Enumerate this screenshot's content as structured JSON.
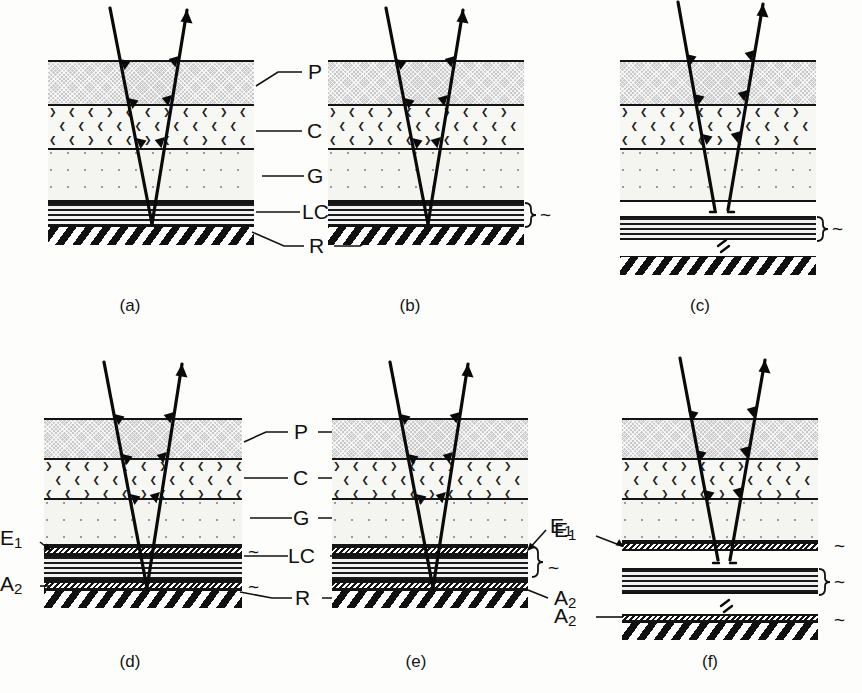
{
  "figure": {
    "type": "optical-layer-stack-diagram",
    "panel_count": 6
  },
  "layer_legend": [
    {
      "key": "P",
      "label": "P",
      "name": "polarizer",
      "texture": "gray-crosshatch"
    },
    {
      "key": "C",
      "label": "C",
      "name": "color-filter",
      "texture": "chevron-field"
    },
    {
      "key": "G",
      "label": "G",
      "name": "glass-substrate",
      "texture": "dot-field"
    },
    {
      "key": "LC",
      "label": "LC",
      "name": "liquid-crystal",
      "texture": "horizontal-stripes"
    },
    {
      "key": "R",
      "label": "R",
      "name": "reflector",
      "texture": "diagonal-hatch"
    },
    {
      "key": "E1",
      "label": "E1",
      "name": "alignment-layer-upper",
      "texture": "sawtooth"
    },
    {
      "key": "A2",
      "label": "A2",
      "name": "alignment-layer-lower",
      "texture": "sawtooth"
    }
  ],
  "center_labels_top": [
    "P",
    "C",
    "G",
    "LC",
    "R"
  ],
  "center_labels_bottom": [
    "P",
    "C",
    "G",
    "LC",
    "R"
  ],
  "panels": [
    {
      "id": "a",
      "caption": "(a)",
      "layers": [
        "P",
        "C",
        "G",
        "LC",
        "R"
      ],
      "separated": false,
      "side_labels": [],
      "tildes": 0,
      "brace": false,
      "ray": "continuous-v-reflection"
    },
    {
      "id": "b",
      "caption": "(b)",
      "layers": [
        "P",
        "C",
        "G",
        "LC",
        "R"
      ],
      "separated": false,
      "side_labels": [],
      "tildes": 1,
      "brace": true,
      "ray": "continuous-v-reflection"
    },
    {
      "id": "c",
      "caption": "(c)",
      "layers": [
        "P",
        "C",
        "G",
        "LC",
        "R"
      ],
      "separated": true,
      "side_labels": [],
      "tildes": 1,
      "brace": true,
      "ray": "broken-v-reflection"
    },
    {
      "id": "d",
      "caption": "(d)",
      "layers": [
        "P",
        "C",
        "G",
        "E1",
        "LC",
        "A2",
        "R"
      ],
      "separated": false,
      "side_labels": [
        "E1",
        "A2"
      ],
      "side_labels_position": "left",
      "tildes": 2,
      "brace": false,
      "ray": "continuous-v-reflection"
    },
    {
      "id": "e",
      "caption": "(e)",
      "layers": [
        "P",
        "C",
        "G",
        "E1",
        "LC",
        "A2",
        "R"
      ],
      "separated": false,
      "side_labels": [
        "E1",
        "A2"
      ],
      "side_labels_position": "right",
      "tildes": 1,
      "brace": true,
      "ray": "continuous-v-reflection"
    },
    {
      "id": "f",
      "caption": "(f)",
      "layers": [
        "P",
        "C",
        "G",
        "E1",
        "LC",
        "A2",
        "R"
      ],
      "separated": true,
      "side_labels": [
        "E1",
        "A2"
      ],
      "side_labels_position": "left",
      "tildes": 3,
      "brace": true,
      "ray": "broken-v-reflection"
    }
  ],
  "colors": {
    "ink": "#111111",
    "polarizer_fill": "#c9c9c9",
    "filter_fill": "#f7f7f4",
    "glass_fill": "#f4f4f1",
    "lc_dark": "#1b1b1b",
    "page_bg": "#fdfdfb"
  }
}
